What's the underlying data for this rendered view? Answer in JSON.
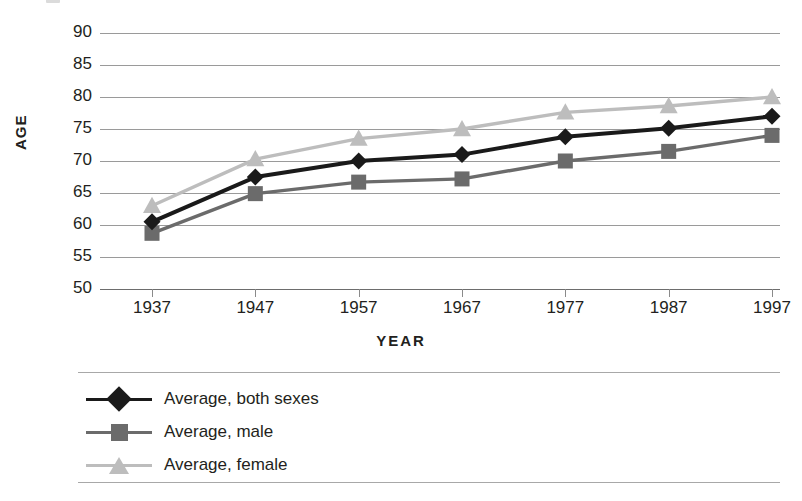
{
  "chart_data": {
    "type": "line",
    "title": "",
    "xlabel": "YEAR",
    "ylabel": "AGE",
    "categories": [
      "1937",
      "1947",
      "1957",
      "1967",
      "1977",
      "1987",
      "1997"
    ],
    "x": [
      1937,
      1947,
      1957,
      1967,
      1977,
      1987,
      1997
    ],
    "ylim": [
      50,
      90
    ],
    "yticks": [
      "50",
      "55",
      "60",
      "65",
      "70",
      "75",
      "80",
      "85",
      "90"
    ],
    "ytick_values": [
      50,
      55,
      60,
      65,
      70,
      75,
      80,
      85,
      90
    ],
    "grid": true,
    "legend_position": "below",
    "series": [
      {
        "name": "Average, both sexes",
        "marker": "diamond",
        "color": "#1a1a1a",
        "values": [
          60.5,
          67.5,
          70.0,
          71.0,
          73.8,
          75.1,
          77.0
        ]
      },
      {
        "name": "Average, male",
        "marker": "square",
        "color": "#6b6b6b",
        "values": [
          58.7,
          64.9,
          66.7,
          67.2,
          70.0,
          71.5,
          74.0
        ]
      },
      {
        "name": "Average, female",
        "marker": "triangle",
        "color": "#bdbdbd",
        "values": [
          63.0,
          70.3,
          73.5,
          75.0,
          77.6,
          78.6,
          80.0
        ]
      }
    ]
  },
  "axes": {
    "y_label": "AGE",
    "x_label": "YEAR"
  },
  "legend": {
    "items": [
      {
        "label": "Average, both sexes",
        "marker": "diamond",
        "color": "#1a1a1a"
      },
      {
        "label": "Average, male",
        "marker": "square",
        "color": "#6b6b6b"
      },
      {
        "label": "Average, female",
        "marker": "triangle",
        "color": "#bdbdbd"
      }
    ]
  },
  "colors": {
    "both_sexes": "#1a1a1a",
    "male": "#6b6b6b",
    "female": "#bdbdbd",
    "gridline": "#9a9a9a",
    "text": "#231f20",
    "background": "#ffffff"
  }
}
